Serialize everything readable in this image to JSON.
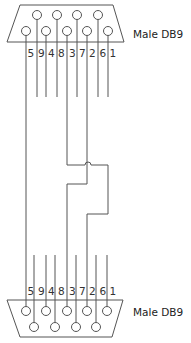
{
  "diagram": {
    "type": "wiring",
    "title": "",
    "colors": {
      "line": "#555555",
      "text": "#222222",
      "background": "#ffffff"
    },
    "top_connector": {
      "label": "Male DB9",
      "pin_order": [
        "5",
        "9",
        "4",
        "8",
        "3",
        "7",
        "2",
        "6",
        "1"
      ],
      "row_upper": [
        "9",
        "8",
        "7",
        "6"
      ],
      "row_lower": [
        "5",
        "4",
        "3",
        "2",
        "1"
      ]
    },
    "bottom_connector": {
      "label": "Male DB9",
      "pin_order": [
        "5",
        "9",
        "4",
        "8",
        "3",
        "7",
        "2",
        "6",
        "1"
      ],
      "row_upper": [
        "5",
        "4",
        "3",
        "2",
        "1"
      ],
      "row_lower": [
        "9",
        "8",
        "7",
        "6"
      ]
    },
    "connections": [
      {
        "from": "5",
        "to": "5",
        "note": "straight through"
      },
      {
        "from": "3",
        "to": "2",
        "note": "crossed"
      },
      {
        "from": "2",
        "to": "3",
        "note": "crossed"
      }
    ],
    "unconnected_pins": [
      "9",
      "4",
      "8",
      "7",
      "6",
      "1"
    ]
  },
  "labels": {
    "top_pins": [
      "5",
      "9",
      "4",
      "8",
      "3",
      "7",
      "2",
      "6",
      "1"
    ],
    "bottom_pins": [
      "5",
      "9",
      "4",
      "8",
      "3",
      "7",
      "2",
      "6",
      "1"
    ],
    "top_connector": "Male DB9",
    "bottom_connector": "Male DB9"
  }
}
